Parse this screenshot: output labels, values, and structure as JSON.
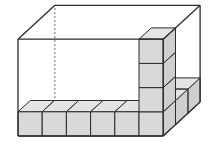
{
  "diagram": {
    "type": "isometric-box-with-unit-cubes",
    "box": {
      "cubes_along_length": 6,
      "cubes_along_width": 3,
      "cubes_along_height": 4
    },
    "visible_cubes": {
      "front_bottom_row": 6,
      "front_right_column_height": 4,
      "right_side_bottom_row": 3
    },
    "colors": {
      "edge": "#2b2b2b",
      "cube_front": "#d9d9d9",
      "cube_top": "#e4e4e4",
      "cube_side": "#cfcfcf",
      "background": "#ffffff",
      "hidden_edge": "#555555"
    }
  }
}
